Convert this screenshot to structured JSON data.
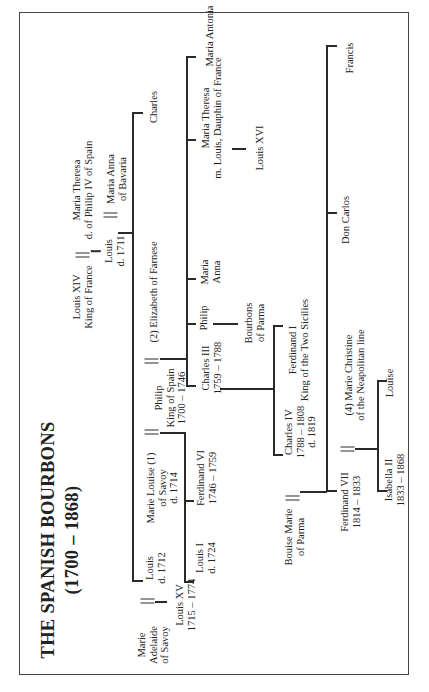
{
  "title": {
    "line1": "THE SPANISH BOURBONS",
    "line2": "(1700 – 1868)"
  },
  "people": {
    "louis_xiv": [
      "Louis XIV",
      "King of France"
    ],
    "maria_theresa_spain": [
      "Maria Theresa",
      "d. of Philip IV of Spain"
    ],
    "louis_1711": [
      "Louis",
      "d. 1711"
    ],
    "maria_anna_bavaria": [
      "Maria Anna",
      "of Bavaria"
    ],
    "charles": [
      "Charles"
    ],
    "louis_1712": [
      "Louis",
      "d. 1712"
    ],
    "marie_adelaide": [
      "Marie",
      "Adelaide",
      "of Savoy"
    ],
    "louis_xv": [
      "Louis XV",
      "1715 – 1774"
    ],
    "marie_louise": [
      "Marie Louise (1)",
      "of Savoy",
      "d. 1714"
    ],
    "philip_v": [
      "Philip",
      "King of Spain",
      "1700 – 1746"
    ],
    "elizabeth_farnese": [
      "(2) Elizabeth of Farnese"
    ],
    "louis_i": [
      "Louis I",
      "d. 1724"
    ],
    "ferdinand_vi": [
      "Ferdinand VI",
      "1746 – 1759"
    ],
    "charles_iii": [
      "Charles III",
      "1759 – 1788"
    ],
    "philip_parma": [
      "Philip"
    ],
    "maria_anna": [
      "Maria",
      "Anna"
    ],
    "maria_theresa_dauphin": [
      "Maria Theresa",
      "m. Louis, Dauphin of France"
    ],
    "maria_antonia": [
      "Maria Antonia"
    ],
    "louis_xvi": [
      "Louis XVI"
    ],
    "bourbons_parma": [
      "Bourbons",
      "of Parma"
    ],
    "ferdinand_i": [
      "Ferdinand I",
      "King of the Two Sicilies"
    ],
    "charles_iv": [
      "Charles IV",
      "1788 – 1808",
      "d. 1819"
    ],
    "bouise_marie": [
      "Bouise Marie",
      "of Parma"
    ],
    "ferdinand_vii": [
      "Ferdinand VII",
      "1814 – 1833"
    ],
    "marie_christine": [
      "(4) Marie Christine",
      "of the Neapolitan line"
    ],
    "isabella_ii": [
      "Isabella II",
      "1833 – 1868"
    ],
    "louise": [
      "Louise"
    ],
    "don_carlos": [
      "Don Carlos"
    ],
    "francis": [
      "Francis"
    ]
  }
}
